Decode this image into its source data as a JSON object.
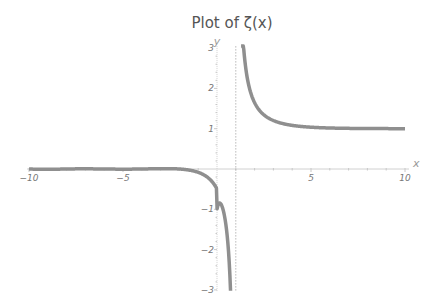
{
  "chart_data": {
    "type": "line",
    "title": "Plot of ζ(x)",
    "xlabel": "x",
    "ylabel": "y",
    "xlim": [
      -10,
      10
    ],
    "ylim": [
      -3,
      3
    ],
    "x_ticks": [
      -10,
      -5,
      5,
      10
    ],
    "y_ticks": [
      -3,
      -2,
      -1,
      1,
      2,
      3
    ],
    "grid": false,
    "legend": null,
    "annotations": [
      "dashed vertical asymptote at x = 1"
    ],
    "series": [
      {
        "name": "ζ(x)",
        "color": "#8f8f8f",
        "x": [
          -10,
          -8,
          -6,
          -5,
          -4,
          -3,
          -2,
          -1.5,
          -1,
          -0.5,
          0,
          0.3,
          0.5,
          0.6,
          0.7,
          1.3,
          1.5,
          2,
          3,
          4,
          5,
          6,
          8,
          10
        ],
        "y": [
          0,
          0,
          0,
          0.004,
          0.008,
          0.008,
          0,
          -0.025,
          -0.083,
          -0.208,
          -0.5,
          -0.903,
          -1.46,
          -1.95,
          -2.78,
          3.93,
          2.61,
          1.645,
          1.202,
          1.082,
          1.037,
          1.017,
          1.004,
          1.001
        ]
      }
    ]
  }
}
